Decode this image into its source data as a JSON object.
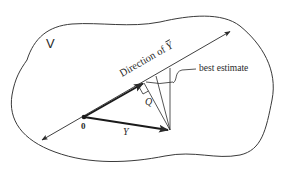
{
  "diagram": {
    "space_label": "V",
    "direction_label_prefix": "Direction of ",
    "direction_label_symbol": "Y",
    "best_estimate_label": "best estimate",
    "q_label": "Q",
    "origin_label": "0",
    "vector_label": "Y",
    "colors": {
      "stroke": "#2a2a2a",
      "background": "#ffffff"
    },
    "points": {
      "origin": [
        84,
        117
      ],
      "y_tip": [
        170,
        130
      ],
      "line_start": [
        40,
        141
      ],
      "line_end": [
        231,
        31
      ],
      "projection_foot": [
        144,
        83
      ]
    }
  }
}
